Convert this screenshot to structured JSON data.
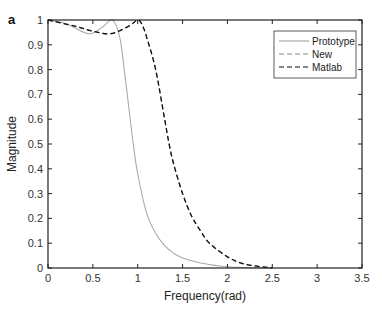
{
  "chart_data": {
    "type": "line",
    "panel_label": "a",
    "title": "",
    "xlabel": "Frequency(rad)",
    "ylabel": "Magnitude",
    "xlim": [
      0,
      3.5
    ],
    "ylim": [
      0,
      1
    ],
    "xticks": [
      "0",
      "0.5",
      "1",
      "1.5",
      "2",
      "2.5",
      "3",
      "3.5"
    ],
    "yticks": [
      "0",
      "0.1",
      "0.2",
      "0.3",
      "0.4",
      "0.5",
      "0.6",
      "0.7",
      "0.8",
      "0.9",
      "1"
    ],
    "grid": false,
    "legend_position": "upper right",
    "series": [
      {
        "name": "Prototype",
        "style": "solid",
        "color": "#aaaaaa",
        "x": [
          0,
          0.2,
          0.45,
          0.6,
          0.72,
          0.8,
          0.85,
          0.9,
          0.95,
          1.0,
          1.1,
          1.2,
          1.3,
          1.4,
          1.5,
          1.7,
          2.0,
          2.5
        ],
        "y": [
          1.0,
          0.985,
          0.945,
          0.97,
          1.0,
          0.93,
          0.8,
          0.65,
          0.5,
          0.38,
          0.22,
          0.14,
          0.09,
          0.06,
          0.04,
          0.02,
          0.005,
          0.0
        ]
      },
      {
        "name": "New",
        "style": "dashed",
        "color": "#888888",
        "x": [
          0,
          0.3,
          0.5,
          0.7,
          0.9,
          1.0,
          1.05,
          1.1,
          1.2,
          1.3,
          1.35,
          1.4,
          1.5,
          1.6,
          1.7,
          1.8,
          2.0,
          2.2,
          2.5
        ],
        "y": [
          1.0,
          0.975,
          0.955,
          0.945,
          0.975,
          1.0,
          0.98,
          0.93,
          0.8,
          0.6,
          0.5,
          0.42,
          0.3,
          0.21,
          0.15,
          0.1,
          0.045,
          0.015,
          0.0
        ]
      },
      {
        "name": "Matlab",
        "style": "dashed",
        "color": "#111111",
        "x": [
          0,
          0.3,
          0.5,
          0.7,
          0.9,
          1.0,
          1.05,
          1.1,
          1.2,
          1.3,
          1.35,
          1.4,
          1.5,
          1.6,
          1.7,
          1.8,
          2.0,
          2.2,
          2.5
        ],
        "y": [
          1.0,
          0.975,
          0.955,
          0.945,
          0.975,
          1.0,
          0.98,
          0.93,
          0.8,
          0.6,
          0.5,
          0.42,
          0.3,
          0.21,
          0.15,
          0.1,
          0.045,
          0.015,
          0.0
        ]
      }
    ]
  }
}
